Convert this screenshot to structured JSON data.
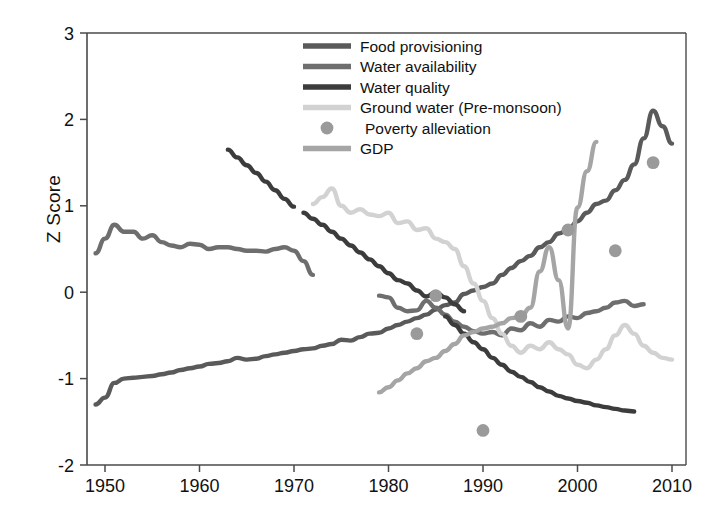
{
  "axes": {
    "ylabel": "Z Score",
    "xlabel": "",
    "xticks": [
      "1950",
      "1960",
      "1970",
      "1980",
      "1990",
      "2000",
      "2010"
    ],
    "yticks": [
      "3",
      "2",
      "1",
      "0",
      "-1",
      "-2"
    ]
  },
  "legend": {
    "position": "top-right",
    "items": [
      {
        "label": "Food provisioning",
        "marker": "line",
        "color": "#5a5a5a"
      },
      {
        "label": "Water availability",
        "marker": "line",
        "color": "#6e6e6e"
      },
      {
        "label": "Water quality",
        "marker": "line",
        "color": "#3c3c3c"
      },
      {
        "label": "Ground water (Pre-monsoon)",
        "marker": "line",
        "color": "#d2d2d2"
      },
      {
        "label": "Poverty alleviation",
        "marker": "dot",
        "color": "#9a9a9a"
      },
      {
        "label": "GDP",
        "marker": "line",
        "color": "#a5a5a5"
      }
    ]
  },
  "chart_data": {
    "type": "line",
    "title": "",
    "xlabel": "",
    "ylabel": "Z Score",
    "xlim": [
      1948,
      2010
    ],
    "ylim": [
      -2,
      3
    ],
    "grid": false,
    "legend_position": "top-right",
    "series": [
      {
        "name": "Food provisioning",
        "type": "line",
        "color": "#5a5a5a",
        "points": [
          [
            1949,
            -1.3
          ],
          [
            1950,
            -1.22
          ],
          [
            1951,
            -1.05
          ],
          [
            1952,
            -1.0
          ],
          [
            1953,
            -0.99
          ],
          [
            1954,
            -0.98
          ],
          [
            1955,
            -0.97
          ],
          [
            1956,
            -0.95
          ],
          [
            1957,
            -0.93
          ],
          [
            1958,
            -0.9
          ],
          [
            1959,
            -0.88
          ],
          [
            1960,
            -0.86
          ],
          [
            1961,
            -0.83
          ],
          [
            1962,
            -0.82
          ],
          [
            1963,
            -0.8
          ],
          [
            1964,
            -0.76
          ],
          [
            1965,
            -0.78
          ],
          [
            1966,
            -0.77
          ],
          [
            1967,
            -0.74
          ],
          [
            1968,
            -0.72
          ],
          [
            1969,
            -0.7
          ],
          [
            1970,
            -0.68
          ],
          [
            1971,
            -0.66
          ],
          [
            1972,
            -0.65
          ],
          [
            1973,
            -0.62
          ],
          [
            1974,
            -0.6
          ],
          [
            1975,
            -0.55
          ],
          [
            1976,
            -0.56
          ],
          [
            1977,
            -0.52
          ],
          [
            1978,
            -0.48
          ],
          [
            1979,
            -0.47
          ],
          [
            1980,
            -0.42
          ],
          [
            1981,
            -0.38
          ],
          [
            1982,
            -0.34
          ],
          [
            1983,
            -0.3
          ],
          [
            1984,
            -0.26
          ],
          [
            1985,
            -0.2
          ],
          [
            1986,
            -0.15
          ],
          [
            1987,
            -0.12
          ],
          [
            1988,
            -0.02
          ],
          [
            1989,
            0.02
          ],
          [
            1990,
            0.06
          ],
          [
            1991,
            0.1
          ],
          [
            1992,
            0.2
          ],
          [
            1993,
            0.28
          ],
          [
            1994,
            0.36
          ],
          [
            1995,
            0.42
          ],
          [
            1996,
            0.52
          ],
          [
            1997,
            0.58
          ],
          [
            1998,
            0.68
          ],
          [
            1999,
            0.72
          ],
          [
            2000,
            0.82
          ],
          [
            2001,
            0.92
          ],
          [
            2002,
            1.02
          ],
          [
            2003,
            1.06
          ],
          [
            2004,
            1.18
          ],
          [
            2005,
            1.3
          ],
          [
            2006,
            1.48
          ],
          [
            2007,
            1.78
          ],
          [
            2008,
            2.1
          ],
          [
            2009,
            1.92
          ],
          [
            2010,
            1.72
          ]
        ]
      },
      {
        "name": "Water availability",
        "type": "line",
        "color": "#6e6e6e",
        "segments": [
          [
            [
              1949,
              0.45
            ],
            [
              1950,
              0.62
            ],
            [
              1951,
              0.78
            ],
            [
              1952,
              0.7
            ],
            [
              1953,
              0.7
            ],
            [
              1954,
              0.62
            ],
            [
              1955,
              0.66
            ],
            [
              1956,
              0.58
            ],
            [
              1957,
              0.54
            ],
            [
              1958,
              0.52
            ],
            [
              1959,
              0.56
            ],
            [
              1960,
              0.55
            ],
            [
              1961,
              0.5
            ],
            [
              1962,
              0.52
            ],
            [
              1963,
              0.52
            ],
            [
              1964,
              0.5
            ],
            [
              1965,
              0.48
            ],
            [
              1966,
              0.48
            ],
            [
              1967,
              0.47
            ],
            [
              1968,
              0.5
            ],
            [
              1969,
              0.52
            ],
            [
              1970,
              0.48
            ],
            [
              1971,
              0.36
            ],
            [
              1972,
              0.2
            ]
          ],
          [
            [
              1979,
              -0.04
            ],
            [
              1980,
              -0.06
            ],
            [
              1981,
              -0.18
            ],
            [
              1982,
              -0.22
            ],
            [
              1983,
              -0.21
            ],
            [
              1984,
              -0.1
            ],
            [
              1985,
              -0.18
            ],
            [
              1986,
              -0.26
            ],
            [
              1987,
              -0.34
            ],
            [
              1988,
              -0.4
            ],
            [
              1989,
              -0.45
            ],
            [
              1990,
              -0.48
            ],
            [
              1991,
              -0.46
            ],
            [
              1992,
              -0.5
            ],
            [
              1993,
              -0.42
            ],
            [
              1994,
              -0.44
            ],
            [
              1995,
              -0.36
            ],
            [
              1996,
              -0.4
            ],
            [
              1997,
              -0.32
            ],
            [
              1998,
              -0.34
            ],
            [
              1999,
              -0.28
            ],
            [
              2000,
              -0.3
            ],
            [
              2001,
              -0.24
            ],
            [
              2002,
              -0.22
            ],
            [
              2003,
              -0.18
            ],
            [
              2004,
              -0.12
            ],
            [
              2005,
              -0.1
            ],
            [
              2006,
              -0.16
            ],
            [
              2007,
              -0.14
            ]
          ]
        ]
      },
      {
        "name": "Water quality",
        "type": "line",
        "color": "#3c3c3c",
        "segments": [
          [
            [
              1963,
              1.65
            ],
            [
              1964,
              1.56
            ],
            [
              1965,
              1.47
            ],
            [
              1966,
              1.38
            ],
            [
              1967,
              1.28
            ],
            [
              1968,
              1.18
            ],
            [
              1969,
              1.08
            ],
            [
              1970,
              0.99
            ]
          ],
          [
            [
              1971,
              0.92
            ],
            [
              1972,
              0.85
            ],
            [
              1973,
              0.78
            ],
            [
              1974,
              0.7
            ],
            [
              1975,
              0.62
            ],
            [
              1976,
              0.54
            ],
            [
              1977,
              0.46
            ],
            [
              1978,
              0.38
            ],
            [
              1979,
              0.3
            ],
            [
              1980,
              0.22
            ],
            [
              1981,
              0.14
            ],
            [
              1982,
              0.1
            ],
            [
              1983,
              0.02
            ],
            [
              1984,
              -0.05
            ],
            [
              1985,
              0.0
            ],
            [
              1986,
              -0.06
            ],
            [
              1987,
              -0.14
            ],
            [
              1988,
              -0.22
            ]
          ],
          [
            [
              1986,
              -0.28
            ],
            [
              1987,
              -0.38
            ],
            [
              1988,
              -0.48
            ],
            [
              1989,
              -0.58
            ],
            [
              1990,
              -0.66
            ],
            [
              1991,
              -0.76
            ],
            [
              1992,
              -0.84
            ],
            [
              1993,
              -0.92
            ],
            [
              1994,
              -0.98
            ],
            [
              1995,
              -1.04
            ],
            [
              1996,
              -1.1
            ],
            [
              1997,
              -1.15
            ],
            [
              1998,
              -1.2
            ],
            [
              1999,
              -1.23
            ],
            [
              2000,
              -1.26
            ],
            [
              2001,
              -1.28
            ],
            [
              2002,
              -1.31
            ],
            [
              2003,
              -1.33
            ],
            [
              2004,
              -1.35
            ],
            [
              2005,
              -1.37
            ],
            [
              2006,
              -1.38
            ]
          ]
        ]
      },
      {
        "name": "Ground water (Pre-monsoon)",
        "type": "line",
        "color": "#d2d2d2",
        "points": [
          [
            1972,
            1.02
          ],
          [
            1973,
            1.1
          ],
          [
            1974,
            1.2
          ],
          [
            1975,
            1.0
          ],
          [
            1976,
            0.92
          ],
          [
            1977,
            0.96
          ],
          [
            1978,
            0.9
          ],
          [
            1979,
            0.88
          ],
          [
            1980,
            0.92
          ],
          [
            1981,
            0.8
          ],
          [
            1982,
            0.82
          ],
          [
            1983,
            0.72
          ],
          [
            1984,
            0.74
          ],
          [
            1985,
            0.62
          ],
          [
            1986,
            0.58
          ],
          [
            1987,
            0.5
          ],
          [
            1988,
            0.3
          ],
          [
            1989,
            0.1
          ],
          [
            1990,
            -0.1
          ],
          [
            1991,
            -0.3
          ],
          [
            1992,
            -0.48
          ],
          [
            1993,
            -0.62
          ],
          [
            1994,
            -0.7
          ],
          [
            1995,
            -0.62
          ],
          [
            1996,
            -0.66
          ],
          [
            1997,
            -0.58
          ],
          [
            1998,
            -0.66
          ],
          [
            1999,
            -0.72
          ],
          [
            2000,
            -0.84
          ],
          [
            2001,
            -0.88
          ],
          [
            2002,
            -0.78
          ],
          [
            2003,
            -0.66
          ],
          [
            2004,
            -0.5
          ],
          [
            2005,
            -0.38
          ],
          [
            2006,
            -0.48
          ],
          [
            2007,
            -0.62
          ],
          [
            2008,
            -0.7
          ],
          [
            2009,
            -0.76
          ],
          [
            2010,
            -0.78
          ]
        ]
      },
      {
        "name": "GDP",
        "type": "line",
        "color": "#a5a5a5",
        "points": [
          [
            1979,
            -1.16
          ],
          [
            1980,
            -1.1
          ],
          [
            1981,
            -1.02
          ],
          [
            1982,
            -0.94
          ],
          [
            1983,
            -0.88
          ],
          [
            1984,
            -0.8
          ],
          [
            1985,
            -0.76
          ],
          [
            1986,
            -0.68
          ],
          [
            1987,
            -0.6
          ],
          [
            1988,
            -0.5
          ],
          [
            1989,
            -0.46
          ],
          [
            1990,
            -0.42
          ],
          [
            1991,
            -0.4
          ],
          [
            1992,
            -0.36
          ],
          [
            1993,
            -0.3
          ],
          [
            1994,
            -0.28
          ],
          [
            1995,
            -0.18
          ],
          [
            1996,
            0.24
          ],
          [
            1997,
            0.52
          ],
          [
            1998,
            0.14
          ],
          [
            1999,
            -0.42
          ],
          [
            2000,
            0.98
          ],
          [
            2001,
            1.4
          ],
          [
            2002,
            1.74
          ]
        ]
      },
      {
        "name": "Poverty alleviation",
        "type": "scatter",
        "color": "#9a9a9a",
        "points": [
          [
            1983,
            -0.48
          ],
          [
            1985,
            -0.04
          ],
          [
            1990,
            -1.6
          ],
          [
            1994,
            -0.28
          ],
          [
            1999,
            0.72
          ],
          [
            2004,
            0.48
          ],
          [
            2008,
            1.5
          ]
        ]
      }
    ]
  }
}
